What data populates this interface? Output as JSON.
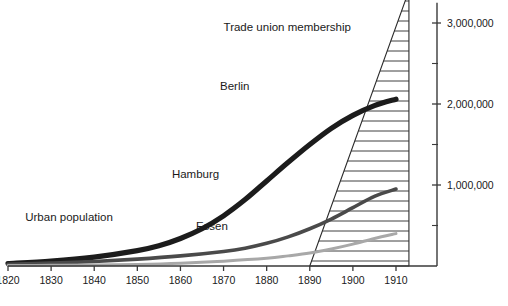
{
  "chart_data": {
    "type": "line",
    "title": "",
    "xlabel": "",
    "ylabel": "",
    "xlim": [
      1820,
      1914
    ],
    "ylim": [
      0,
      3200000
    ],
    "grid": false,
    "legend_position": "inline-labels",
    "x_ticks": [
      "1820",
      "1830",
      "1840",
      "1850",
      "1860",
      "1870",
      "1880",
      "1890",
      "1900",
      "1910"
    ],
    "x_tick_values": [
      1820,
      1830,
      1840,
      1850,
      1860,
      1870,
      1880,
      1890,
      1900,
      1910
    ],
    "y_ticks": [
      "1,000,000",
      "2,000,000",
      "3,000,000"
    ],
    "y_tick_values": [
      1000000,
      2000000,
      3000000
    ],
    "y_minor_tick_values": [
      500000,
      1500000,
      2500000
    ],
    "annotations": [
      {
        "name": "trade-union-membership",
        "text": "Trade union membership",
        "x": 1870,
        "y": 2900000
      },
      {
        "name": "berlin",
        "text": "Berlin",
        "x": 1876,
        "y": 2170000
      },
      {
        "name": "hamburg",
        "text": "Hamburg",
        "x": 1869,
        "y": 1090000
      },
      {
        "name": "essen",
        "text": "Essen",
        "x": 1871,
        "y": 440000
      },
      {
        "name": "urban-population",
        "text": "Urban population",
        "x": 1824,
        "y": 560000
      }
    ],
    "series": [
      {
        "name": "Berlin",
        "color": "#1c1c1c",
        "x": [
          1820,
          1830,
          1840,
          1850,
          1855,
          1860,
          1865,
          1870,
          1875,
          1880,
          1885,
          1890,
          1895,
          1900,
          1905,
          1910
        ],
        "values": [
          30000,
          60000,
          110000,
          190000,
          250000,
          340000,
          460000,
          620000,
          820000,
          1050000,
          1280000,
          1500000,
          1700000,
          1860000,
          1980000,
          2060000
        ]
      },
      {
        "name": "Hamburg",
        "color": "#4a4a4a",
        "x": [
          1820,
          1830,
          1840,
          1850,
          1860,
          1870,
          1875,
          1880,
          1885,
          1890,
          1895,
          1900,
          1905,
          1910
        ],
        "values": [
          20000,
          35000,
          55000,
          85000,
          125000,
          180000,
          220000,
          280000,
          360000,
          460000,
          580000,
          720000,
          860000,
          950000
        ]
      },
      {
        "name": "Essen",
        "color": "#a8a8a8",
        "x": [
          1820,
          1830,
          1840,
          1850,
          1860,
          1870,
          1880,
          1885,
          1890,
          1895,
          1900,
          1905,
          1910
        ],
        "values": [
          5000,
          8000,
          12000,
          20000,
          35000,
          60000,
          95000,
          125000,
          160000,
          210000,
          270000,
          340000,
          400000
        ]
      }
    ],
    "wedge": {
      "name": "Trade union membership",
      "pattern": "horizontal-hatch",
      "x_start": 1890,
      "x_end": 1913,
      "apex_value": 3400000,
      "base_value": 0
    }
  }
}
